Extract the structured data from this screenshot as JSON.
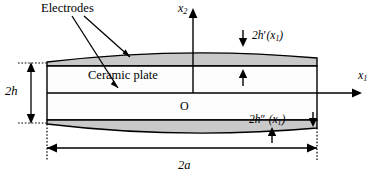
{
  "figure": {
    "labels": {
      "electrodes": "Electrodes",
      "ceramic_plate": "Ceramic plate",
      "axis_vertical": "x",
      "axis_vertical_sub": "2",
      "axis_horizontal": "x",
      "axis_horizontal_sub": "1",
      "origin": "O",
      "thickness": "2h",
      "width": "2a",
      "upper_electrode": "2h",
      "upper_electrode_prime": "′",
      "upper_electrode_arg": "(x",
      "upper_electrode_arg_sub": "1",
      "upper_electrode_arg_close": ")",
      "lower_electrode": "2h",
      "lower_electrode_prime": "″",
      "lower_electrode_arg": "(x",
      "lower_electrode_arg_sub": "1",
      "lower_electrode_arg_close": ")"
    },
    "colors": {
      "stroke": "#000000",
      "electrode_fill": "#c9c9c9",
      "plate_fill": "#ffffff",
      "background": "#ffffff"
    },
    "geometry": {
      "plate_left_x": 47,
      "plate_right_x": 317,
      "plate_top_y": 62,
      "plate_bottom_y": 124,
      "midline_y": 93,
      "electrode_bulge_px": 9
    }
  }
}
